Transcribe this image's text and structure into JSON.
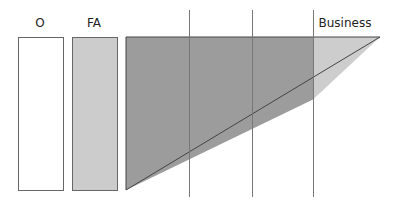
{
  "labels": {
    "o": "O",
    "fa": "FA",
    "business": "Business"
  },
  "colors": {
    "o_fill": "#ffffff",
    "fa_fill": "#cccccc",
    "triangle_dark": "#9a9a9a",
    "triangle_light": "#cdcdcd",
    "stroke": "#555555",
    "divider": "#777777"
  }
}
